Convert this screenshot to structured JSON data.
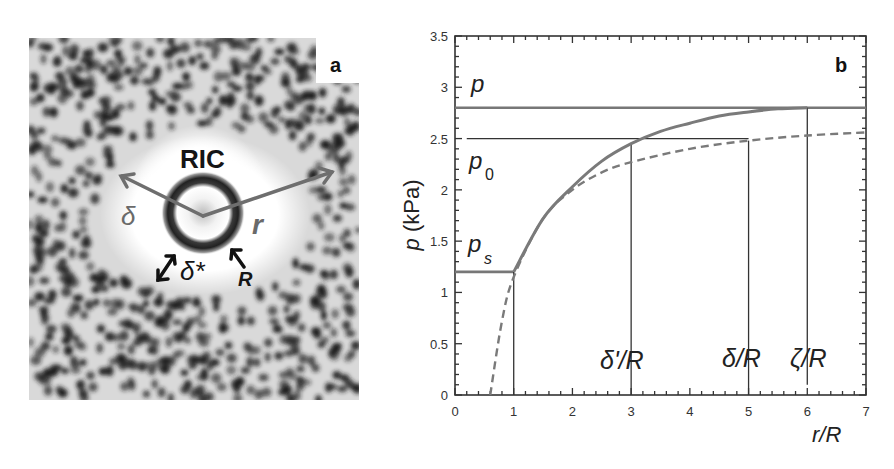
{
  "panel_a": {
    "label": "a",
    "title": "RIC",
    "annotations": {
      "delta": "δ",
      "r": "r",
      "delta_star": "δ*",
      "R": "R"
    },
    "colors": {
      "arrow": "#6e6e6e",
      "ring": "#2a2a2a",
      "label_dark": "#1a1a1a"
    }
  },
  "panel_b": {
    "label": "b",
    "curve_labels": {
      "p": "p",
      "p0": "p",
      "p0_sub": "0",
      "ps": "p",
      "ps_sub": "s"
    },
    "xmark_labels": {
      "delta_prime": "δ'/R",
      "delta": "δ/R",
      "zeta": "ζ/R"
    }
  },
  "chart_data": {
    "type": "line",
    "title": "",
    "panel_label": "b",
    "xlabel": "r/R",
    "ylabel": "p (kPa)",
    "xlim": [
      0,
      7
    ],
    "ylim": [
      0,
      3.5
    ],
    "xticks": [
      "0",
      "1",
      "2",
      "3",
      "4",
      "5",
      "6",
      "7"
    ],
    "yticks": [
      "0",
      "0.5",
      "1",
      "1.5",
      "2",
      "2.5",
      "3",
      "3.5"
    ],
    "grid": false,
    "legend": null,
    "horizontal_lines": [
      {
        "name": "p",
        "y": 2.8,
        "x_range": [
          0,
          7
        ],
        "style": "solid-thick"
      },
      {
        "name": "p0",
        "y": 2.5,
        "x_range": [
          0.2,
          5
        ],
        "style": "solid-thin"
      },
      {
        "name": "ps",
        "y": 1.2,
        "x_range": [
          0,
          1
        ],
        "style": "solid-thick"
      }
    ],
    "vertical_lines": [
      {
        "name": "R",
        "x": 1,
        "y_top": 1.2
      },
      {
        "name": "delta_prime/R",
        "x": 3,
        "y_top": 2.45
      },
      {
        "name": "delta/R",
        "x": 5,
        "y_top": 2.48
      },
      {
        "name": "zeta/R",
        "x": 6,
        "y_top": 2.8,
        "y_bottom": 0.1
      }
    ],
    "series": [
      {
        "name": "pressure profile (solid)",
        "style": "solid",
        "x": [
          1.0,
          1.5,
          2.0,
          2.5,
          3.0,
          3.5,
          4.0,
          4.5,
          5.0,
          5.5,
          6.0
        ],
        "values": [
          1.2,
          1.72,
          2.03,
          2.28,
          2.45,
          2.57,
          2.65,
          2.72,
          2.76,
          2.79,
          2.8
        ]
      },
      {
        "name": "pressure profile (dashed)",
        "style": "dashed",
        "x": [
          0.6,
          0.8,
          1.0,
          1.5,
          2.0,
          2.5,
          3.0,
          4.0,
          5.0,
          6.0,
          7.0
        ],
        "values": [
          0.0,
          0.72,
          1.15,
          1.72,
          2.0,
          2.17,
          2.27,
          2.4,
          2.48,
          2.53,
          2.56
        ]
      }
    ],
    "annotations": [
      "p",
      "p0",
      "ps",
      "δ'/R",
      "δ/R",
      "ζ/R",
      "b"
    ]
  }
}
